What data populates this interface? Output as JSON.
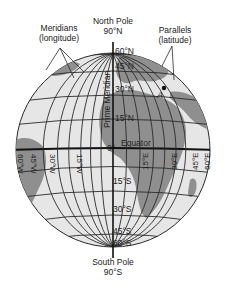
{
  "figure": {
    "colors": {
      "ocean": "#e6e6e6",
      "land": "#8f8f8f",
      "grid": "#2a2a2a",
      "equator": "#111111",
      "text": "#222222"
    }
  },
  "labels": {
    "north_pole": "North Pole",
    "north_pole_deg": "90°N",
    "south_pole": "South Pole",
    "south_pole_deg": "90°S",
    "meridians": "Meridians",
    "meridians_sub": "(longitude)",
    "parallels": "Parallels",
    "parallels_sub": "(latitude)",
    "prime_meridian": "Prime Meridian",
    "equator": "Equator",
    "zero": "0°",
    "point_a": "A"
  },
  "latitudes_north": [
    "60°N",
    "45°N",
    "30°N",
    "15°N"
  ],
  "latitudes_south": [
    "15°S",
    "30°S",
    "45°S",
    "60°S"
  ],
  "longitudes_west": [
    "60°W",
    "45°W",
    "30°W",
    "15°W"
  ],
  "longitudes_east": [
    "15°E",
    "30°E",
    "45°E",
    "60°E"
  ]
}
